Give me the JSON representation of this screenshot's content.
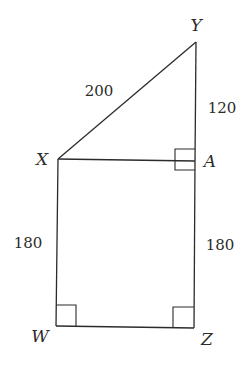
{
  "diagram": {
    "type": "geometry-figure",
    "vertices": [
      {
        "name": "Y",
        "x": 196,
        "y": 42,
        "label_x": 196,
        "label_y": 31
      },
      {
        "name": "X",
        "x": 58,
        "y": 159,
        "label_x": 42,
        "label_y": 165
      },
      {
        "name": "A",
        "x": 195,
        "y": 161,
        "label_x": 210,
        "label_y": 167
      },
      {
        "name": "W",
        "x": 56,
        "y": 326,
        "label_x": 40,
        "label_y": 342
      },
      {
        "name": "Z",
        "x": 194,
        "y": 328,
        "label_x": 207,
        "label_y": 345
      }
    ],
    "segments": [
      {
        "from": "X",
        "to": "Y",
        "length": "200"
      },
      {
        "from": "Y",
        "to": "A",
        "length": "120"
      },
      {
        "from": "X",
        "to": "A",
        "length": ""
      },
      {
        "from": "X",
        "to": "W",
        "length": "180"
      },
      {
        "from": "A",
        "to": "Z",
        "length": "180"
      },
      {
        "from": "W",
        "to": "Z",
        "length": ""
      }
    ],
    "measure_labels": [
      {
        "text": "200",
        "x": 99,
        "y": 96
      },
      {
        "text": "120",
        "x": 222,
        "y": 113
      },
      {
        "text": "180",
        "x": 28,
        "y": 248
      },
      {
        "text": "180",
        "x": 220,
        "y": 250
      }
    ],
    "right_angles": [
      "A",
      "W",
      "Z"
    ]
  }
}
